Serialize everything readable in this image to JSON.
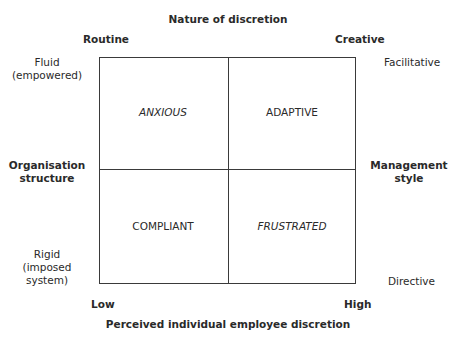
{
  "diagram": {
    "top_title": "Nature of discretion",
    "top_left": "Routine",
    "top_right": "Creative",
    "bottom_title": "Perceived individual employee discretion",
    "bottom_left": "Low",
    "bottom_right": "High",
    "left_axis": {
      "title_line1": "Organisation",
      "title_line2": "structure",
      "top_line1": "Fluid",
      "top_line2": "(empowered)",
      "bottom_line1": "Rigid",
      "bottom_line2": "(imposed",
      "bottom_line3": "system)"
    },
    "right_axis": {
      "title_line1": "Management",
      "title_line2": "style",
      "top": "Facilitative",
      "bottom": "Directive"
    },
    "quadrants": {
      "top_left": "ANXIOUS",
      "top_right": "ADAPTIVE",
      "bottom_left": "COMPLIANT",
      "bottom_right": "FRUSTRATED"
    }
  }
}
